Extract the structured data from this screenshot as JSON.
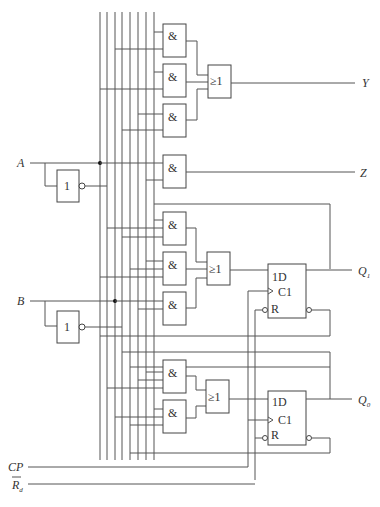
{
  "diagram": {
    "type": "sequential logic circuit",
    "inputs": {
      "a": "A",
      "b": "B",
      "cp": "CP",
      "rd": "R",
      "rd_sub": "d"
    },
    "outputs": {
      "y": "Y",
      "z": "Z",
      "q1": "Q",
      "q1_sub": "1",
      "q0": "Q",
      "q0_sub": "0"
    },
    "gate_symbols": {
      "and": "&",
      "or": "≥1",
      "not": "1"
    },
    "flipflop_pins": {
      "d": "1D",
      "clk": "C1",
      "reset": "R"
    },
    "bus_line_count": 8
  }
}
